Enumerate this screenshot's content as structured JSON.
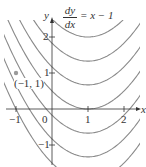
{
  "figure": {
    "equation": {
      "numerator": "dy",
      "denominator": "dx",
      "rhs": "= x − 1"
    },
    "axes": {
      "x_label": "x",
      "y_label": "y",
      "x_ticks": [
        "−1",
        "0",
        "1",
        "2"
      ],
      "y_ticks": [
        "2",
        "1",
        "−1"
      ]
    },
    "point": {
      "label": "(−1, 1)",
      "x": -1,
      "y": 1
    },
    "colors": {
      "curve": "#8a8a8a",
      "axis": "#333333",
      "point": "#9a9a9a"
    }
  },
  "chart_data": {
    "type": "line",
    "xlabel": "x",
    "ylabel": "y",
    "xlim": [
      -1.3,
      2.4
    ],
    "ylim": [
      -1.6,
      2.5
    ],
    "family": "y = x²/2 − x + C",
    "C_values": [
      -1.5,
      -0.83,
      -0.17,
      0.5,
      1.17,
      1.83,
      2.5,
      3.17,
      3.83,
      4.5,
      5.17
    ],
    "highlighted_point": {
      "label": "(−1, 1)",
      "x": -1,
      "y": 1
    },
    "x_ticks": [
      -1,
      0,
      1,
      2
    ],
    "y_ticks": [
      -1,
      1,
      2
    ],
    "grid": false
  }
}
